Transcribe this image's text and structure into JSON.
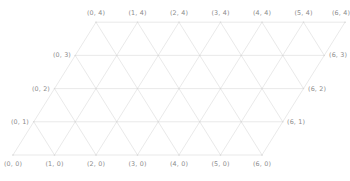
{
  "figure": {
    "type": "triangular-lattice-grid",
    "background_color": "#ffffff",
    "line_color": "#e6e6e6",
    "node_color": "#d8d8d8",
    "label_color": "#8c8c8c"
  },
  "grid": {
    "cols": 7,
    "rows": 5,
    "x_indices": [
      0,
      1,
      2,
      3,
      4,
      5,
      6
    ],
    "y_indices": [
      0,
      1,
      2,
      3,
      4
    ],
    "origin_x": 13,
    "origin_y": 155,
    "spacing_x": 41.5,
    "spacing_y": 33.2,
    "row_shear": 20.75
  },
  "labels": {
    "bottom": [
      {
        "text": "(0, 0)",
        "x": 13,
        "y": 161
      },
      {
        "text": "(1, 0)",
        "x": 54.5,
        "y": 161
      },
      {
        "text": "(2, 0)",
        "x": 96,
        "y": 161
      },
      {
        "text": "(3, 0)",
        "x": 137.5,
        "y": 161
      },
      {
        "text": "(4, 0)",
        "x": 179,
        "y": 161
      },
      {
        "text": "(5, 0)",
        "x": 220.5,
        "y": 161
      },
      {
        "text": "(6, 0)",
        "x": 262,
        "y": 161
      }
    ],
    "top": [
      {
        "text": "(0, 4)",
        "x": 96,
        "y": 16
      },
      {
        "text": "(1, 4)",
        "x": 137.5,
        "y": 16
      },
      {
        "text": "(2, 4)",
        "x": 179,
        "y": 16
      },
      {
        "text": "(3, 4)",
        "x": 220.5,
        "y": 16
      },
      {
        "text": "(4, 4)",
        "x": 262,
        "y": 16
      },
      {
        "text": "(5, 4)",
        "x": 303.5,
        "y": 16
      },
      {
        "text": "(6, 4)",
        "x": 341,
        "y": 16
      }
    ],
    "left": [
      {
        "text": "(0, 1)",
        "x": 29,
        "y": 121.8
      },
      {
        "text": "(0, 2)",
        "x": 50,
        "y": 88.6
      },
      {
        "text": "(0, 3)",
        "x": 71,
        "y": 55.4
      }
    ],
    "right": [
      {
        "text": "(6, 1)",
        "x": 287,
        "y": 121.8
      },
      {
        "text": "(6, 2)",
        "x": 308,
        "y": 88.6
      },
      {
        "text": "(6, 3)",
        "x": 329,
        "y": 55.4
      }
    ]
  }
}
